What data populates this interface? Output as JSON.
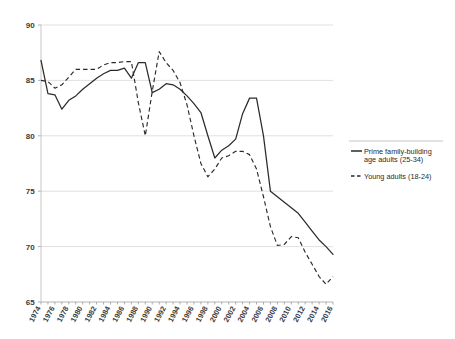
{
  "chart_data": {
    "type": "line",
    "title": "",
    "subtitle": "",
    "xlabel": "",
    "ylabel": "",
    "ylim": [
      65,
      90
    ],
    "xlim": [
      1974,
      2016
    ],
    "yticks": [
      "65",
      "70",
      "75",
      "80",
      "85",
      "90"
    ],
    "grid": "horizontal",
    "legend_position": "right",
    "x": [
      1974,
      1975,
      1976,
      1977,
      1978,
      1979,
      1980,
      1981,
      1982,
      1983,
      1984,
      1985,
      1986,
      1987,
      1988,
      1989,
      1990,
      1991,
      1992,
      1993,
      1994,
      1995,
      1996,
      1997,
      1998,
      1999,
      2000,
      2001,
      2002,
      2003,
      2004,
      2005,
      2006,
      2007,
      2008,
      2009,
      2010,
      2011,
      2012,
      2013,
      2014,
      2015,
      2016
    ],
    "xtick_labels": [
      "1974",
      "1976",
      "1978",
      "1980",
      "1982",
      "1984",
      "1986",
      "1988",
      "1990",
      "1992",
      "1994",
      "1996",
      "1998",
      "2000",
      "2002",
      "2004",
      "2006",
      "2008",
      "2010",
      "2012",
      "2014",
      "2016"
    ],
    "series": [
      {
        "name": "Prime family-building age adults (25-34)",
        "style": "solid",
        "color": "#2b2b2b",
        "values": [
          86.8,
          83.8,
          83.7,
          82.4,
          83.2,
          83.6,
          84.2,
          84.7,
          85.2,
          85.6,
          85.9,
          85.9,
          86.1,
          85.2,
          86.6,
          86.6,
          83.9,
          84.2,
          84.7,
          84.6,
          84.2,
          83.6,
          82.9,
          82.1,
          80.0,
          78.0,
          78.7,
          79.1,
          79.7,
          82.0,
          83.4,
          83.4,
          80.0,
          75.0,
          74.5,
          74.0,
          73.5,
          73.0,
          72.2,
          71.4,
          70.6,
          70.0,
          69.3
        ]
      },
      {
        "name": "Young adults (18-24)",
        "style": "dashed",
        "color": "#2b2b2b",
        "values": [
          85.0,
          84.9,
          84.3,
          84.6,
          85.3,
          86.0,
          86.0,
          86.0,
          86.0,
          86.4,
          86.6,
          86.6,
          86.7,
          86.7,
          83.0,
          80.0,
          84.0,
          87.6,
          86.6,
          85.9,
          84.8,
          82.8,
          80.0,
          77.5,
          76.3,
          77.0,
          78.0,
          78.2,
          78.6,
          78.6,
          78.3,
          77.0,
          74.5,
          71.8,
          70.1,
          70.2,
          70.9,
          70.8,
          69.5,
          68.4,
          67.3,
          66.6,
          67.3
        ]
      }
    ]
  },
  "legend": {
    "items": [
      {
        "label_line1": "Prime family-building",
        "label_line2": "age adults (25-34)",
        "style": "solid"
      },
      {
        "label_line1": "Young adults (18-24)",
        "label_line2": "",
        "style": "dashed"
      }
    ]
  },
  "colors": {
    "line": "#2b2b2b",
    "grid": "#d2d2d2",
    "axis": "#b9b9b9",
    "tick_text": "#3b3b3b",
    "background": "#ffffff"
  }
}
